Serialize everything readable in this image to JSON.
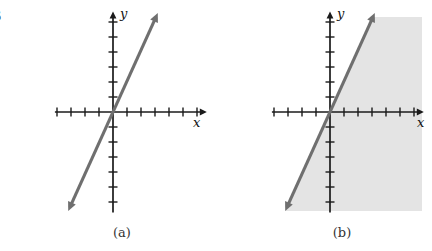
{
  "edge_fragment": {
    "text": "3"
  },
  "colors": {
    "background": "#ffffff",
    "axis": "#1b1b1b",
    "line": "#6f6f6f",
    "shade": "#e4e4e4",
    "caption": "#333333"
  },
  "chart_data": [
    {
      "type": "line",
      "panel": "a",
      "title": "(a)",
      "caption": "(a)",
      "equation": "y = 2x",
      "xlabel": "x",
      "ylabel": "y",
      "series": [
        {
          "name": "y = 2x",
          "slope": 2,
          "intercept": 0,
          "points": [
            [
              -3.2,
              -6.6
            ],
            [
              3.2,
              6.6
            ]
          ],
          "arrows": "both"
        }
      ],
      "xlim": [
        -4.15,
        6.7
      ],
      "ylim": [
        -6.7,
        6.7
      ],
      "x_ticks": [
        -4,
        -3,
        -2,
        -1,
        1,
        2,
        3,
        4,
        5,
        6
      ],
      "y_ticks": [
        -6,
        -5,
        -4,
        -3,
        -2,
        -1,
        1,
        2,
        3,
        4,
        5,
        6
      ],
      "grid": false,
      "legend": false,
      "shaded": false,
      "layout_px": {
        "origin_x": 113,
        "origin_y": 112,
        "unit_x": 14,
        "unit_y": 15
      }
    },
    {
      "type": "line",
      "panel": "b",
      "title": "(b)",
      "caption": "(b)",
      "equation": "y = 2x",
      "inequality": "y ≤ 2x",
      "xlabel": "x",
      "ylabel": "y",
      "series": [
        {
          "name": "y = 2x",
          "slope": 2,
          "intercept": 0,
          "points": [
            [
              -3.2,
              -6.6
            ],
            [
              3.2,
              6.6
            ]
          ],
          "arrows": "both"
        }
      ],
      "xlim": [
        -4.15,
        6.7
      ],
      "ylim": [
        -6.7,
        6.7
      ],
      "x_ticks": [
        -4,
        -3,
        -2,
        -1,
        1,
        2,
        3,
        4,
        5,
        6
      ],
      "y_ticks": [
        -6,
        -5,
        -4,
        -3,
        -2,
        -1,
        1,
        2,
        3,
        4,
        5,
        6
      ],
      "grid": false,
      "legend": false,
      "shaded": true,
      "shade_region": {
        "relation": "y ≤ 2x",
        "side": "right-of-line",
        "top_px": 17,
        "right_px": 422,
        "bottom_px": 211
      },
      "layout_px": {
        "origin_x": 330,
        "origin_y": 112,
        "unit_x": 14,
        "unit_y": 15
      }
    }
  ]
}
